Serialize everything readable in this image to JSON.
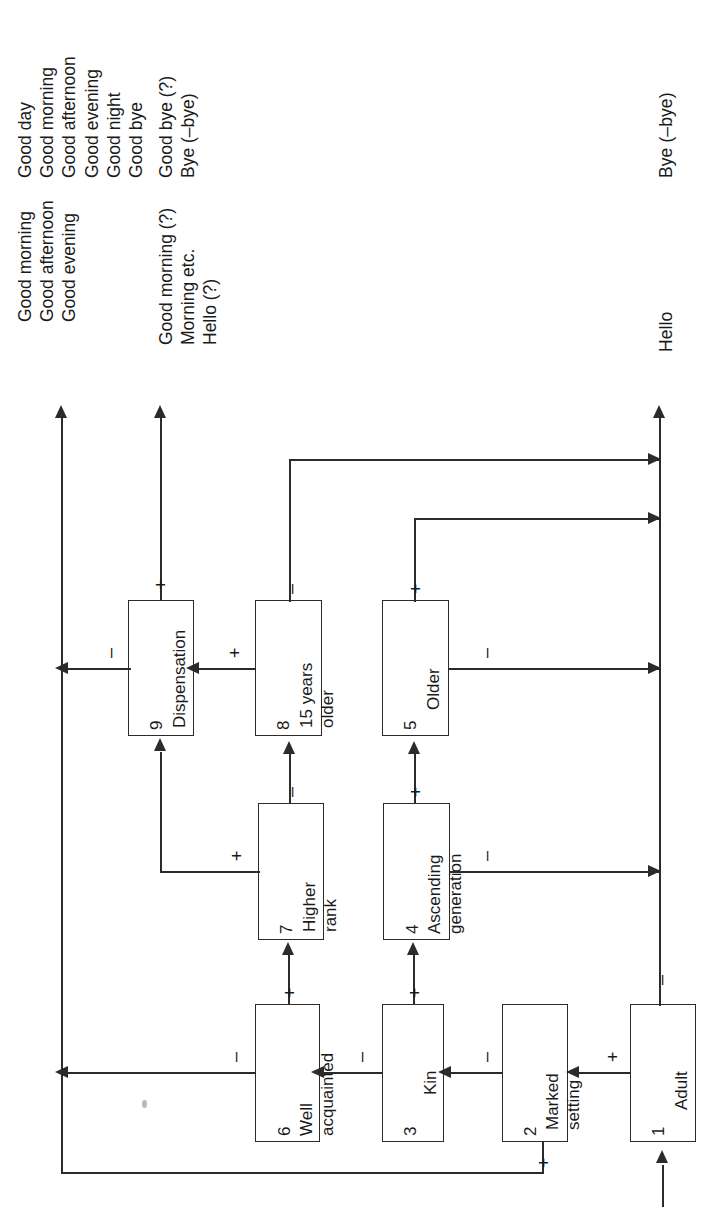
{
  "figure": {
    "orientation": "rotated-90-ccw",
    "type": "flowchart-decision-tree",
    "line_color": "#2b2b2b",
    "background": "#ffffff"
  },
  "outputs": [
    {
      "id": "out-dispensation-plus",
      "lines": [
        "Good day",
        "Good morning",
        "Good afternoon",
        "Good evening",
        "Good night",
        "Good bye"
      ]
    },
    {
      "id": "out-dispensation-plus-b",
      "lines": [
        "Good bye (?)",
        "Bye (–bye)"
      ]
    },
    {
      "id": "out-left-terminal",
      "lines": [
        "Good morning",
        "Good afternoon",
        "Good evening"
      ]
    },
    {
      "id": "out-left-terminal-b",
      "lines": [
        "Good morning (?)",
        "Morning etc.",
        "Hello (?)"
      ]
    },
    {
      "id": "out-hello",
      "lines": [
        "Hello"
      ]
    },
    {
      "id": "out-bye",
      "lines": [
        "Bye (–bye)"
      ]
    }
  ],
  "boxes": [
    {
      "num": "1",
      "label": "Adult",
      "label2": ""
    },
    {
      "num": "2",
      "label": "Marked",
      "label2": "setting"
    },
    {
      "num": "3",
      "label": "Kin",
      "label2": ""
    },
    {
      "num": "4",
      "label": "Ascending",
      "label2": "generation"
    },
    {
      "num": "5",
      "label": "Older",
      "label2": ""
    },
    {
      "num": "6",
      "label": "Well",
      "label2": "acquainted"
    },
    {
      "num": "7",
      "label": "Higher",
      "label2": "rank"
    },
    {
      "num": "8",
      "label": "15 years",
      "label2": "older"
    },
    {
      "num": "9",
      "label": "Dispensation",
      "label2": ""
    }
  ],
  "signs": {
    "plus": "+",
    "minus": "–"
  },
  "edges": [
    {
      "from": "start",
      "to": "1",
      "sign": ""
    },
    {
      "from": "1",
      "to": "2",
      "sign": "+"
    },
    {
      "from": "1",
      "to": "hello-axis",
      "sign": "–"
    },
    {
      "from": "2",
      "to": "3",
      "sign": "–"
    },
    {
      "from": "2",
      "to": "left-axis",
      "sign": "+"
    },
    {
      "from": "3",
      "to": "6",
      "sign": "–"
    },
    {
      "from": "3",
      "to": "4",
      "sign": "+"
    },
    {
      "from": "4",
      "to": "5",
      "sign": "+"
    },
    {
      "from": "4",
      "to": "hello-axis",
      "sign": "–"
    },
    {
      "from": "5",
      "to": "bye-axis",
      "sign": "+"
    },
    {
      "from": "5",
      "to": "hello-axis",
      "sign": "–"
    },
    {
      "from": "6",
      "to": "7",
      "sign": "+"
    },
    {
      "from": "6",
      "to": "left-axis",
      "sign": "–"
    },
    {
      "from": "7",
      "to": "8",
      "sign": "–"
    },
    {
      "from": "7",
      "to": "9",
      "sign": "+"
    },
    {
      "from": "8",
      "to": "9",
      "sign": "+"
    },
    {
      "from": "8",
      "to": "bye-axis",
      "sign": "–"
    },
    {
      "from": "9",
      "to": "out-greetings",
      "sign": "+"
    },
    {
      "from": "9",
      "to": "left-axis",
      "sign": "–"
    }
  ]
}
